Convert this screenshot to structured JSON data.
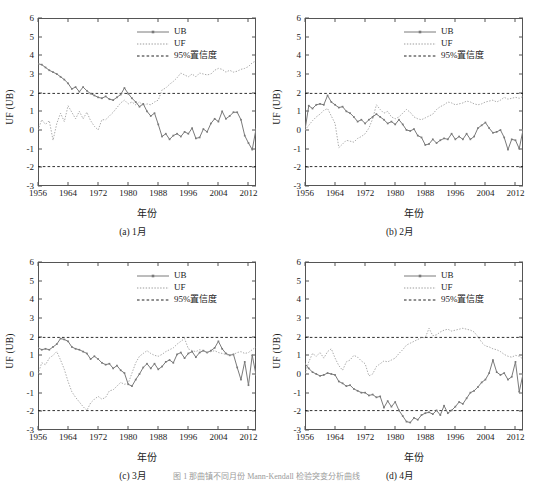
{
  "figure": {
    "panel_count": 4,
    "bottom_caption": "图 1  那曲镇不同月份 Mann-Kendall 检验突变分析曲线"
  },
  "axes": {
    "ylabel": "UF (UB)",
    "xlabel": "年份",
    "yticks": [
      -3,
      -2,
      -1,
      0,
      1,
      2,
      3,
      4,
      5,
      6
    ],
    "ytick_labels": [
      "-3",
      "-2",
      "-1",
      "0",
      "1",
      "2",
      "3",
      "4",
      "5",
      "6"
    ],
    "xticks": [
      1956,
      1964,
      1972,
      1980,
      1988,
      1996,
      2004,
      2012
    ],
    "xtick_labels": [
      "1956",
      "1964",
      "1972",
      "1980",
      "1988",
      "1996",
      "2004",
      "2012"
    ],
    "xlim": [
      1956,
      2014
    ],
    "ylim": [
      -3,
      6
    ]
  },
  "legend": {
    "items": [
      {
        "label": "UB",
        "style": "solid-marker",
        "color": "#7a7a7a"
      },
      {
        "label": "UF",
        "style": "dotted",
        "color": "#9b9b9b"
      },
      {
        "label": "95%置信度",
        "style": "dashed",
        "color": "#222222"
      }
    ]
  },
  "colors": {
    "ub_line": "#7a7a7a",
    "uf_line": "#9b9b9b",
    "confidence_line": "#1a1a1a",
    "frame": "#555555",
    "background": "#ffffff"
  },
  "chart_data": [
    {
      "type": "line",
      "panel_id": "a",
      "caption": "(a) 1月",
      "title": "",
      "xlabel": "年份",
      "ylabel": "UF (UB)",
      "xlim": [
        1956,
        2014
      ],
      "ylim": [
        -3,
        6
      ],
      "grid": false,
      "legend_position": "top-right",
      "annotations": [
        "95% confidence bounds at +1.96 and -1.96"
      ],
      "confidence_levels": [
        1.96,
        -1.96
      ],
      "x": [
        1956,
        1957,
        1958,
        1959,
        1960,
        1961,
        1962,
        1963,
        1964,
        1965,
        1966,
        1967,
        1968,
        1969,
        1970,
        1971,
        1972,
        1973,
        1974,
        1975,
        1976,
        1977,
        1978,
        1979,
        1980,
        1981,
        1982,
        1983,
        1984,
        1985,
        1986,
        1987,
        1988,
        1989,
        1990,
        1991,
        1992,
        1993,
        1994,
        1995,
        1996,
        1997,
        1998,
        1999,
        2000,
        2001,
        2002,
        2003,
        2004,
        2005,
        2006,
        2007,
        2008,
        2009,
        2010,
        2011,
        2012,
        2013,
        2014
      ],
      "series": [
        {
          "name": "UB",
          "values": [
            3.55,
            3.5,
            3.35,
            3.2,
            3.1,
            3.0,
            2.85,
            2.7,
            2.5,
            2.2,
            2.3,
            2.05,
            2.3,
            2.1,
            1.95,
            1.85,
            1.75,
            1.7,
            1.8,
            1.65,
            1.6,
            1.75,
            1.9,
            2.25,
            1.95,
            1.7,
            1.5,
            1.25,
            1.4,
            1.0,
            0.75,
            0.9,
            0.3,
            -0.35,
            -0.2,
            -0.5,
            -0.3,
            -0.2,
            -0.35,
            -0.1,
            -0.2,
            0.1,
            -0.45,
            -0.4,
            0.05,
            -0.1,
            0.35,
            0.6,
            0.45,
            1.0,
            0.6,
            0.75,
            0.95,
            0.95,
            0.55,
            -0.3,
            -0.7,
            -1.05,
            0.05
          ]
        },
        {
          "name": "UF",
          "values": [
            0.0,
            0.55,
            0.3,
            0.5,
            -0.55,
            0.35,
            0.9,
            0.45,
            1.3,
            0.95,
            0.6,
            1.0,
            0.6,
            0.95,
            0.5,
            0.2,
            0.0,
            0.55,
            0.55,
            0.75,
            0.95,
            1.2,
            1.45,
            1.6,
            1.4,
            1.5,
            1.35,
            1.5,
            1.3,
            1.4,
            1.35,
            1.5,
            1.6,
            2.15,
            2.25,
            2.45,
            2.6,
            2.8,
            3.05,
            2.95,
            2.85,
            3.0,
            2.85,
            3.05,
            3.0,
            2.95,
            3.0,
            3.2,
            3.3,
            3.25,
            3.1,
            3.2,
            3.1,
            3.15,
            3.25,
            3.3,
            3.4,
            3.6,
            3.7
          ]
        }
      ]
    },
    {
      "type": "line",
      "panel_id": "b",
      "caption": "(b) 2月",
      "title": "",
      "xlabel": "年份",
      "ylabel": "UF (UB)",
      "xlim": [
        1956,
        2014
      ],
      "ylim": [
        -3,
        6
      ],
      "grid": false,
      "legend_position": "top-right",
      "annotations": [
        "95% confidence bounds at +1.96 and -1.96"
      ],
      "confidence_levels": [
        1.96,
        -1.96
      ],
      "x": [
        1956,
        1957,
        1958,
        1959,
        1960,
        1961,
        1962,
        1963,
        1964,
        1965,
        1966,
        1967,
        1968,
        1969,
        1970,
        1971,
        1972,
        1973,
        1974,
        1975,
        1976,
        1977,
        1978,
        1979,
        1980,
        1981,
        1982,
        1983,
        1984,
        1985,
        1986,
        1987,
        1988,
        1989,
        1990,
        1991,
        1992,
        1993,
        1994,
        1995,
        1996,
        1997,
        1998,
        1999,
        2000,
        2001,
        2002,
        2003,
        2004,
        2005,
        2006,
        2007,
        2008,
        2009,
        2010,
        2011,
        2012,
        2013,
        2014
      ],
      "series": [
        {
          "name": "UB",
          "values": [
            0.0,
            1.3,
            1.15,
            1.35,
            1.4,
            1.35,
            1.85,
            1.5,
            1.35,
            1.2,
            1.25,
            1.0,
            0.9,
            0.7,
            0.45,
            0.55,
            0.35,
            0.55,
            0.7,
            0.85,
            0.7,
            0.55,
            0.35,
            0.45,
            0.3,
            0.55,
            0.3,
            0.0,
            -0.05,
            0.05,
            -0.3,
            -0.4,
            -0.8,
            -0.75,
            -0.5,
            -0.7,
            -0.55,
            -0.45,
            -0.5,
            -0.2,
            -0.5,
            -0.35,
            -0.5,
            -0.2,
            -0.5,
            -0.35,
            0.1,
            0.25,
            0.4,
            0.1,
            -0.15,
            -0.1,
            0.0,
            -0.4,
            -1.05,
            -0.5,
            -0.55,
            -1.0,
            0.0
          ]
        },
        {
          "name": "UF",
          "values": [
            0.0,
            0.25,
            0.5,
            0.7,
            0.85,
            1.05,
            1.15,
            0.75,
            0.35,
            -0.95,
            -0.75,
            -0.55,
            -0.6,
            -0.65,
            -0.45,
            -0.35,
            -0.2,
            0.1,
            0.6,
            1.35,
            1.1,
            0.9,
            1.0,
            0.7,
            0.6,
            0.7,
            0.9,
            1.1,
            0.95,
            0.7,
            0.6,
            0.55,
            0.65,
            0.75,
            0.85,
            1.1,
            1.25,
            1.35,
            1.5,
            1.45,
            1.35,
            1.4,
            1.45,
            1.55,
            1.5,
            1.4,
            1.35,
            1.4,
            1.5,
            1.55,
            1.6,
            1.5,
            1.6,
            1.75,
            1.65,
            1.7,
            1.75,
            1.7,
            1.8
          ]
        }
      ]
    },
    {
      "type": "line",
      "panel_id": "c",
      "caption": "(c) 3月",
      "title": "",
      "xlabel": "年份",
      "ylabel": "UF (UB)",
      "xlim": [
        1956,
        2014
      ],
      "ylim": [
        -3,
        6
      ],
      "grid": false,
      "legend_position": "top-right",
      "annotations": [
        "95% confidence bounds at +1.96 and -1.96"
      ],
      "confidence_levels": [
        1.96,
        -1.96
      ],
      "x": [
        1956,
        1957,
        1958,
        1959,
        1960,
        1961,
        1962,
        1963,
        1964,
        1965,
        1966,
        1967,
        1968,
        1969,
        1970,
        1971,
        1972,
        1973,
        1974,
        1975,
        1976,
        1977,
        1978,
        1979,
        1980,
        1981,
        1982,
        1983,
        1984,
        1985,
        1986,
        1987,
        1988,
        1989,
        1990,
        1991,
        1992,
        1993,
        1994,
        1995,
        1996,
        1997,
        1998,
        1999,
        2000,
        2001,
        2002,
        2003,
        2004,
        2005,
        2006,
        2007,
        2008,
        2009,
        2010,
        2011,
        2012,
        2013,
        2014
      ],
      "series": [
        {
          "name": "UB",
          "values": [
            1.4,
            1.3,
            1.35,
            1.3,
            1.45,
            1.6,
            1.9,
            1.85,
            1.75,
            1.45,
            1.35,
            1.3,
            1.2,
            1.1,
            0.8,
            0.95,
            0.8,
            0.6,
            0.5,
            0.55,
            0.3,
            0.45,
            0.2,
            0.05,
            -0.55,
            -0.65,
            -0.3,
            0.0,
            0.35,
            0.55,
            0.3,
            0.55,
            0.25,
            0.4,
            0.65,
            0.75,
            0.6,
            1.05,
            1.15,
            0.85,
            1.1,
            1.2,
            0.9,
            1.15,
            1.25,
            1.15,
            1.25,
            1.4,
            1.75,
            1.35,
            1.1,
            1.0,
            1.05,
            0.35,
            -0.3,
            0.65,
            -0.6,
            1.0,
            -0.05
          ]
        },
        {
          "name": "UF",
          "values": [
            0.0,
            0.6,
            0.5,
            0.85,
            1.0,
            1.2,
            0.75,
            0.25,
            -0.4,
            -0.95,
            -1.25,
            -1.5,
            -1.75,
            -1.95,
            -1.55,
            -1.35,
            -1.2,
            -1.35,
            -1.25,
            -0.9,
            -0.85,
            -0.65,
            -0.45,
            -0.55,
            -0.5,
            0.05,
            0.6,
            0.95,
            1.1,
            1.25,
            1.1,
            1.0,
            0.95,
            1.05,
            1.2,
            1.3,
            1.4,
            1.6,
            1.75,
            1.9,
            1.35,
            1.25,
            1.2,
            1.3,
            1.25,
            1.15,
            1.2,
            1.25,
            1.15,
            1.1,
            1.05,
            1.0,
            1.05,
            1.15,
            1.2,
            1.1,
            1.15,
            1.3,
            1.45
          ]
        }
      ]
    },
    {
      "type": "line",
      "panel_id": "d",
      "caption": "(d) 4月",
      "title": "",
      "xlabel": "年份",
      "ylabel": "UF (UB)",
      "xlim": [
        1956,
        2014
      ],
      "ylim": [
        -3,
        6
      ],
      "grid": false,
      "legend_position": "top-right",
      "annotations": [
        "95% confidence bounds at +1.96 and -1.96"
      ],
      "confidence_levels": [
        1.96,
        -1.96
      ],
      "x": [
        1956,
        1957,
        1958,
        1959,
        1960,
        1961,
        1962,
        1963,
        1964,
        1965,
        1966,
        1967,
        1968,
        1969,
        1970,
        1971,
        1972,
        1973,
        1974,
        1975,
        1976,
        1977,
        1978,
        1979,
        1980,
        1981,
        1982,
        1983,
        1984,
        1985,
        1986,
        1987,
        1988,
        1989,
        1990,
        1991,
        1992,
        1993,
        1994,
        1995,
        1996,
        1997,
        1998,
        1999,
        2000,
        2001,
        2002,
        2003,
        2004,
        2005,
        2006,
        2007,
        2008,
        2009,
        2010,
        2011,
        2012,
        2013,
        2014
      ],
      "series": [
        {
          "name": "UB",
          "values": [
            0.55,
            0.3,
            0.1,
            0.0,
            -0.1,
            -0.05,
            0.05,
            0.0,
            -0.05,
            -0.4,
            -0.5,
            -0.65,
            -0.6,
            -0.8,
            -0.9,
            -1.0,
            -1.0,
            -1.15,
            -1.1,
            -1.25,
            -1.2,
            -1.8,
            -1.45,
            -1.75,
            -1.5,
            -1.95,
            -2.25,
            -2.55,
            -2.6,
            -2.35,
            -2.45,
            -2.2,
            -2.1,
            -2.05,
            -2.15,
            -1.95,
            -2.2,
            -1.7,
            -2.1,
            -1.95,
            -1.75,
            -1.5,
            -1.6,
            -1.3,
            -1.0,
            -0.9,
            -0.7,
            -0.45,
            -0.3,
            0.05,
            0.75,
            0.1,
            -0.05,
            0.05,
            -0.3,
            -0.15,
            0.65,
            -0.95,
            0.0
          ]
        },
        {
          "name": "UF",
          "values": [
            0.0,
            0.65,
            1.1,
            0.95,
            1.15,
            0.85,
            1.2,
            1.35,
            0.85,
            0.45,
            0.2,
            0.65,
            0.75,
            1.0,
            0.9,
            0.7,
            0.55,
            -0.1,
            0.0,
            0.4,
            0.55,
            0.7,
            0.65,
            0.75,
            0.85,
            1.1,
            1.3,
            1.55,
            1.65,
            1.75,
            1.85,
            1.95,
            1.95,
            2.45,
            2.05,
            2.1,
            2.25,
            2.35,
            2.4,
            2.3,
            2.35,
            2.4,
            2.45,
            2.4,
            2.35,
            2.25,
            2.0,
            1.7,
            1.5,
            1.45,
            1.35,
            1.3,
            1.2,
            1.05,
            0.95,
            0.9,
            1.0,
            0.95,
            0.8
          ]
        }
      ]
    }
  ]
}
